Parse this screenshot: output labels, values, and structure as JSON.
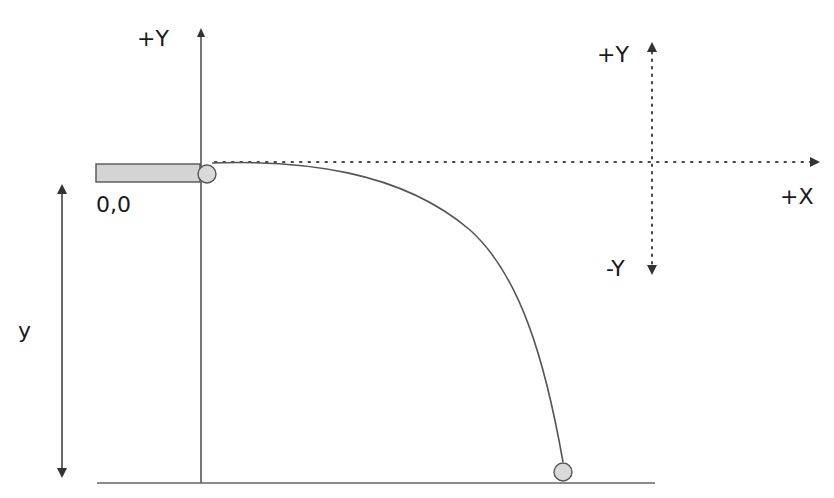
{
  "diagram": {
    "type": "projectile-motion",
    "labels": {
      "main_plus_y": "+Y",
      "origin": "0,0",
      "height": "y",
      "legend_plus_y": "+Y",
      "legend_minus_y": "-Y",
      "legend_plus_x": "+X"
    },
    "colors": {
      "line": "#555555",
      "ledge_fill": "#d4d4d4",
      "ball_fill": "#d9d9d9",
      "text": "#1a1a1a"
    }
  }
}
